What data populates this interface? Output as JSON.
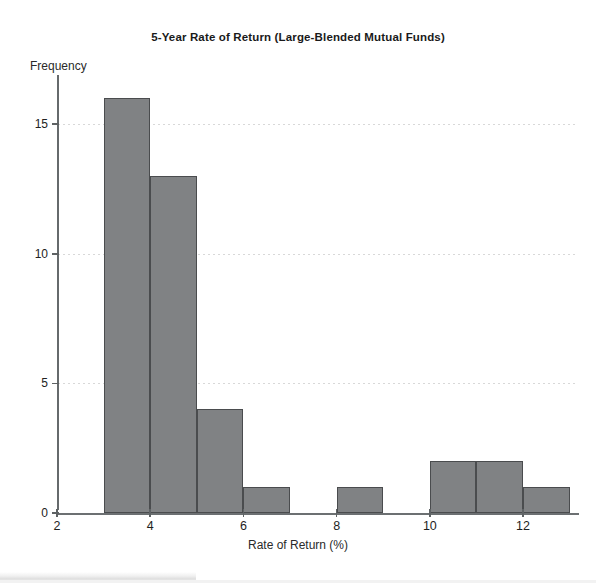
{
  "chart_data": {
    "type": "bar",
    "title": "5-Year Rate of Return (Large-Blended Mutual Funds)",
    "xlabel": "Rate of Return (%)",
    "ylabel": "Frequency",
    "bin_width": 1,
    "bins": [
      {
        "left": 3,
        "right": 4,
        "value": 16
      },
      {
        "left": 4,
        "right": 5,
        "value": 13
      },
      {
        "left": 5,
        "right": 6,
        "value": 4
      },
      {
        "left": 6,
        "right": 7,
        "value": 1
      },
      {
        "left": 7,
        "right": 8,
        "value": 0
      },
      {
        "left": 8,
        "right": 9,
        "value": 1
      },
      {
        "left": 9,
        "right": 10,
        "value": 0
      },
      {
        "left": 10,
        "right": 11,
        "value": 2
      },
      {
        "left": 11,
        "right": 12,
        "value": 2
      },
      {
        "left": 12,
        "right": 13,
        "value": 1
      }
    ],
    "xlim": [
      2,
      13.2
    ],
    "ylim": [
      0,
      16.9
    ],
    "xticks": [
      2,
      4,
      6,
      8,
      10,
      12
    ],
    "yticks": [
      0,
      5,
      10,
      15
    ],
    "xtick_labels": [
      "2",
      "4",
      "6",
      "8",
      "10",
      "12"
    ],
    "ytick_labels": [
      "0",
      "5",
      "10",
      "15"
    ],
    "grid": "horizontal-dotted",
    "legend": null,
    "bar_color": "#808284",
    "bar_edge_color": "#4a4c4e",
    "axis_color": "#666a6c",
    "grid_color": "#d8d8d8",
    "total_count": 40
  }
}
